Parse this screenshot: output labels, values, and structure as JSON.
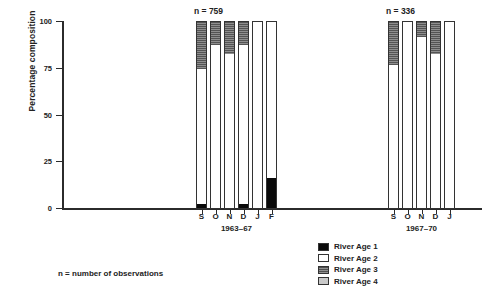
{
  "chart_data": {
    "type": "bar",
    "subtype": "stacked-percentage",
    "title": "",
    "xlabel": "",
    "ylabel": "Percentage composition",
    "ylim": [
      0,
      100
    ],
    "yticks": [
      0,
      25,
      50,
      75,
      100
    ],
    "ytick_labels": [
      "0",
      "25",
      "50",
      "75",
      "100"
    ],
    "grid": false,
    "legend_position": "bottom-center",
    "legend": [
      {
        "key": "age1",
        "label": "River Age 1",
        "color": "#0a0a0a",
        "fill": "solid-black"
      },
      {
        "key": "age2",
        "label": "River Age 2",
        "color": "#ffffff",
        "fill": "solid-white"
      },
      {
        "key": "age3",
        "label": "River Age 3",
        "color": "#7a7a7a",
        "fill": "horizontal-hatch-dark"
      },
      {
        "key": "age4",
        "label": "River Age 4",
        "color": "#c9c9c9",
        "fill": "solid-light-gray"
      }
    ],
    "series": [
      {
        "name": "River Age 1",
        "values": [
          3,
          0,
          0,
          3,
          0,
          17,
          0,
          0,
          0,
          0,
          0
        ]
      },
      {
        "name": "River Age 2",
        "values": [
          72,
          88,
          83,
          85,
          100,
          83,
          77,
          100,
          92,
          83,
          100
        ]
      },
      {
        "name": "River Age 3",
        "values": [
          25,
          12,
          17,
          12,
          0,
          0,
          23,
          0,
          8,
          17,
          0
        ]
      },
      {
        "name": "River Age 4",
        "values": [
          0,
          0,
          0,
          0,
          0,
          0,
          0,
          0,
          0,
          0,
          0
        ]
      }
    ],
    "groups": [
      {
        "id": "group-1963-67",
        "period_label": "1963–67",
        "n_label": "n = 759",
        "n_value": 759,
        "categories": [
          "S",
          "O",
          "N",
          "D",
          "J",
          "F"
        ],
        "bars": [
          {
            "month": "S",
            "age1": 3,
            "age2": 72,
            "age3": 25,
            "age4": 0
          },
          {
            "month": "O",
            "age1": 0,
            "age2": 88,
            "age3": 12,
            "age4": 0
          },
          {
            "month": "N",
            "age1": 0,
            "age2": 83,
            "age3": 17,
            "age4": 0
          },
          {
            "month": "D",
            "age1": 3,
            "age2": 85,
            "age3": 12,
            "age4": 0
          },
          {
            "month": "J",
            "age1": 0,
            "age2": 100,
            "age3": 0,
            "age4": 0
          },
          {
            "month": "F",
            "age1": 17,
            "age2": 83,
            "age3": 0,
            "age4": 0
          }
        ]
      },
      {
        "id": "group-1967-70",
        "period_label": "1967–70",
        "n_label": "n = 336",
        "n_value": 336,
        "categories": [
          "S",
          "O",
          "N",
          "D",
          "J"
        ],
        "bars": [
          {
            "month": "S",
            "age1": 0,
            "age2": 77,
            "age3": 23,
            "age4": 0
          },
          {
            "month": "O",
            "age1": 0,
            "age2": 100,
            "age3": 0,
            "age4": 0
          },
          {
            "month": "N",
            "age1": 0,
            "age2": 92,
            "age3": 8,
            "age4": 0
          },
          {
            "month": "D",
            "age1": 0,
            "age2": 83,
            "age3": 17,
            "age4": 0
          },
          {
            "month": "J",
            "age1": 0,
            "age2": 100,
            "age3": 0,
            "age4": 0
          }
        ]
      }
    ],
    "annotations": [
      {
        "key": "footnote",
        "text": "n = number of observations"
      }
    ]
  },
  "axis": {
    "ylabel": "Percentage composition",
    "ticks": [
      {
        "value": 100,
        "label": "100"
      },
      {
        "value": 75,
        "label": "75"
      },
      {
        "value": 50,
        "label": "50"
      },
      {
        "value": 25,
        "label": "25"
      },
      {
        "value": 0,
        "label": "0"
      }
    ]
  },
  "footnote": {
    "text": "n = number of observations"
  }
}
